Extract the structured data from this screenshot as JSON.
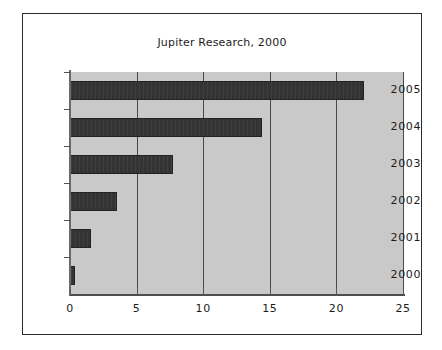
{
  "chart_data": {
    "type": "bar",
    "orientation": "horizontal",
    "title": "Jupiter Research, 2000",
    "xlabel": "",
    "ylabel": "",
    "categories": [
      "2005",
      "2004",
      "2003",
      "2002",
      "2001",
      "2000"
    ],
    "values": [
      22.1,
      14.4,
      7.7,
      3.5,
      1.6,
      0.35
    ],
    "series": [
      {
        "name": "Jupiter Research, 2000",
        "values": [
          22.1,
          14.4,
          7.7,
          3.5,
          1.6,
          0.35
        ]
      }
    ],
    "xlim": [
      0,
      25
    ],
    "xticks": [
      0,
      5,
      10,
      15,
      20,
      25
    ],
    "xtick_labels": [
      "0",
      "5",
      "10",
      "15",
      "20",
      "25"
    ],
    "ytick_labels": [
      "2005",
      "2004",
      "2003",
      "2002",
      "2001",
      "2000"
    ],
    "grid": true,
    "grid_axis": "x",
    "legend": false,
    "legend_position": "none",
    "colors": {
      "bar_fill": "#333333",
      "plot_background": "#c9c9c9",
      "figure_background": "#ffffff",
      "gridline": "#4a4a4a",
      "axis": "#555555",
      "text": "#1c1c1c",
      "frame_border": "#2b2b2b"
    }
  }
}
